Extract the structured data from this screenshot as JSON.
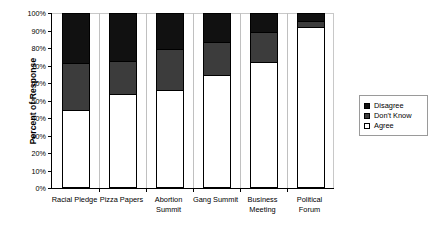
{
  "chart_data": {
    "type": "bar",
    "subtype": "stacked-100",
    "title": "",
    "xlabel": "",
    "ylabel": "Percent of Response",
    "ylim": [
      0,
      100
    ],
    "ytick_labels": [
      "0%",
      "10%",
      "20%",
      "30%",
      "40%",
      "50%",
      "60%",
      "70%",
      "80%",
      "90%",
      "100%"
    ],
    "ytick_values": [
      0,
      10,
      20,
      30,
      40,
      50,
      60,
      70,
      80,
      90,
      100
    ],
    "grid": false,
    "legend_position": "right",
    "categories": [
      "Racial Pledge",
      "Pizza Papers",
      "Abortion\nSummit",
      "Gang Summit",
      "Business\nMeeting",
      "Political\nForum"
    ],
    "series": [
      {
        "name": "Agree",
        "color": "#ffffff",
        "values": [
          46,
          55,
          57,
          66,
          73,
          93
        ]
      },
      {
        "name": "Don't Know",
        "color": "#3c3c3c",
        "values": [
          26,
          18,
          23,
          18,
          17,
          3
        ]
      },
      {
        "name": "Disagree",
        "color": "#111111",
        "values": [
          28,
          27,
          20,
          16,
          10,
          4
        ]
      }
    ],
    "stack_order_bottom_to_top": [
      "Agree",
      "Don't Know",
      "Disagree"
    ]
  },
  "legend": {
    "entries": [
      {
        "label": "Disagree",
        "color": "#111111"
      },
      {
        "label": "Don't Know",
        "color": "#3c3c3c"
      },
      {
        "label": "Agree",
        "color": "#ffffff"
      }
    ]
  },
  "axes": {
    "y_title": "Percent of Response"
  }
}
